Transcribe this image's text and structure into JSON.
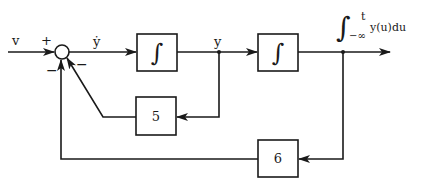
{
  "diagram": {
    "input": {
      "label": "v"
    },
    "summing_junction": {
      "signs": {
        "input": "+",
        "inner_feedback": "−",
        "outer_feedback": "−"
      }
    },
    "signals": {
      "y_dot": "ẏ",
      "y": "y",
      "output": {
        "integral_symbol": "∫",
        "upper_limit": "t",
        "lower_limit": "−∞",
        "integrand": "y(u)du"
      }
    },
    "blocks": [
      {
        "id": "integrator-1",
        "label": "∫"
      },
      {
        "id": "integrator-2",
        "label": "∫"
      },
      {
        "id": "gain-inner",
        "label": "5"
      },
      {
        "id": "gain-outer",
        "label": "6"
      }
    ],
    "colors": {
      "ink": "#1a1a1a",
      "background": "#ffffff"
    }
  }
}
